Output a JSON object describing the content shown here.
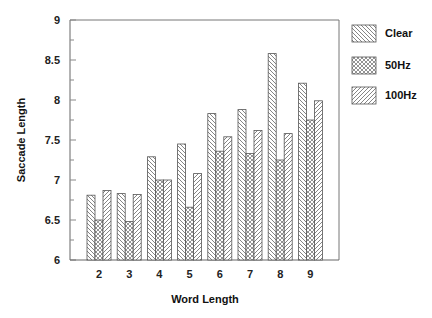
{
  "chart_data": {
    "type": "bar",
    "title": "",
    "xlabel": "Word Length",
    "ylabel": "Saccade Length",
    "categories": [
      "2",
      "3",
      "4",
      "5",
      "6",
      "7",
      "8",
      "9"
    ],
    "series": [
      {
        "name": "Clear",
        "pattern": "diagonal-backslash",
        "values": [
          6.81,
          6.83,
          7.29,
          7.45,
          7.83,
          7.88,
          8.58,
          8.21
        ]
      },
      {
        "name": "50Hz",
        "pattern": "crosshatch",
        "values": [
          6.5,
          6.48,
          7.0,
          6.66,
          7.36,
          7.33,
          7.25,
          7.75
        ]
      },
      {
        "name": "100Hz",
        "pattern": "diagonal-slash",
        "values": [
          6.87,
          6.82,
          7.0,
          7.08,
          7.54,
          7.62,
          7.58,
          7.99
        ]
      }
    ],
    "ylim": [
      6,
      9
    ],
    "yticks": [
      "6",
      "6.5",
      "7",
      "7.5",
      "8",
      "8.5",
      "9"
    ],
    "grid": false,
    "legend_position": "right-top"
  },
  "colors": {
    "stroke": "#555555",
    "axis": "#666666",
    "text": "#111111",
    "background": "#ffffff"
  }
}
